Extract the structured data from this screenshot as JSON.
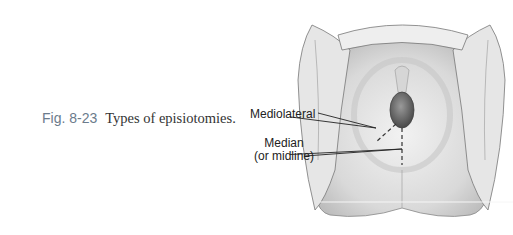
{
  "caption": {
    "figure_number": "Fig. 8-23",
    "text": "Types of episiotomies."
  },
  "illustration": {
    "labels": {
      "mediolateral": "Mediolateral",
      "median_line1": "Median",
      "median_line2": "(or midline)"
    }
  }
}
